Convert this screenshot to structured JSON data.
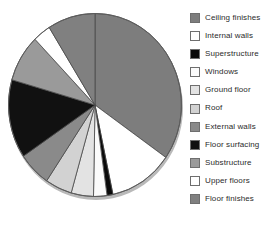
{
  "chart_data": {
    "type": "pie",
    "title": "",
    "subtitle": "",
    "xlabel": "",
    "ylabel": "",
    "grid": false,
    "legend_position": "right",
    "start_angle_deg": 0,
    "direction": "clockwise",
    "categories": [
      "Ceiling finishes",
      "Internal walls",
      "Superstructure",
      "Windows",
      "Ground floor",
      "Roof",
      "External walls",
      "Floor surfacing",
      "Substructure",
      "Upper floors",
      "Floor finishes"
    ],
    "values": [
      34.7,
      11.9,
      1.1,
      2.5,
      4.2,
      5.0,
      6.1,
      13.9,
      8.3,
      3.3,
      9.0
    ],
    "units": "percent",
    "slice_angles_deg": [
      125,
      43,
      4,
      9,
      15,
      18,
      22,
      50,
      30,
      12,
      32
    ],
    "colors": [
      "#7d7d7d",
      "#ffffff",
      "#0a0a0a",
      "#fbfbfb",
      "#e3e3e3",
      "#d2d2d2",
      "#8a8a8a",
      "#111111",
      "#9a9a9a",
      "#ffffff",
      "#808080"
    ]
  },
  "legend": {
    "items": [
      {
        "label": "Ceiling finishes",
        "color": "#7d7d7d"
      },
      {
        "label": "Internal walls",
        "color": "#ffffff"
      },
      {
        "label": "Superstructure",
        "color": "#0a0a0a"
      },
      {
        "label": "Windows",
        "color": "#fbfbfb"
      },
      {
        "label": "Ground floor",
        "color": "#e3e3e3"
      },
      {
        "label": "Roof",
        "color": "#d2d2d2"
      },
      {
        "label": "External walls",
        "color": "#8a8a8a"
      },
      {
        "label": "Floor surfacing",
        "color": "#111111"
      },
      {
        "label": "Substructure",
        "color": "#9a9a9a"
      },
      {
        "label": "Upper floors",
        "color": "#ffffff"
      },
      {
        "label": "Floor finishes",
        "color": "#808080"
      }
    ]
  }
}
